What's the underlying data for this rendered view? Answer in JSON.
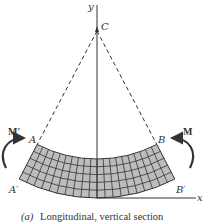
{
  "diagram": {
    "labels": {
      "y_axis": "y",
      "x_axis": "x",
      "center": "C",
      "point_a": "A",
      "point_b": "B",
      "point_a_prime": "A′",
      "point_b_prime": "B′",
      "moment_left": "M′",
      "moment_right": "M"
    },
    "caption_prefix": "(a)",
    "caption": "Longitudinal, vertical section",
    "beam": {
      "rows": 5,
      "columns": 20,
      "fill_color": "#bdbdbd",
      "grid_color": "#333333"
    }
  }
}
